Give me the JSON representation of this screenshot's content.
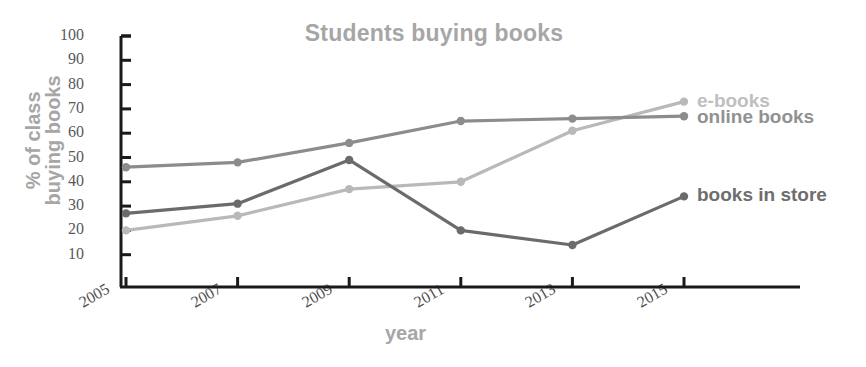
{
  "chart_data": {
    "type": "line",
    "title": "Students buying books",
    "xlabel": "year",
    "ylabel_line1": "% of class",
    "ylabel_line2": "buying books",
    "categories": [
      "2005",
      "2007",
      "2009",
      "2011",
      "2013",
      "2015"
    ],
    "x": [
      2005,
      2007,
      2009,
      2011,
      2013,
      2015
    ],
    "ylim": [
      0,
      100
    ],
    "yticks": [
      100,
      90,
      80,
      70,
      60,
      50,
      40,
      30,
      20,
      10
    ],
    "grid": false,
    "legend_position": "right-inline",
    "series": [
      {
        "name": "e-books",
        "values": [
          20,
          26,
          37,
          40,
          61,
          73
        ],
        "color": "#b9b9b9",
        "label_color": "#bfbfbf"
      },
      {
        "name": "online books",
        "values": [
          46,
          48,
          56,
          65,
          66,
          67
        ],
        "color": "#8c8c8c",
        "label_color": "#919191"
      },
      {
        "name": "books in store",
        "values": [
          27,
          31,
          49,
          20,
          14,
          34
        ],
        "color": "#6b6b6b",
        "label_color": "#6e6e6e"
      }
    ]
  },
  "axis": {
    "line_color": "#1a1a1a",
    "tick_color": "#1a1a1a"
  }
}
